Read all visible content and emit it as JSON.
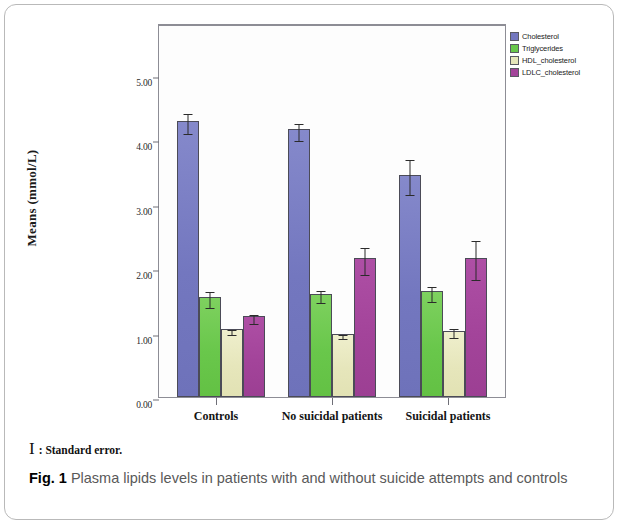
{
  "figure": {
    "label": "Fig. 1",
    "caption": "Plasma lipids levels in patients with and without suicide attempts and controls",
    "footnote_glyph": "I",
    "footnote_text": ": Standard error."
  },
  "chart_data": {
    "type": "bar",
    "title": "",
    "xlabel": "",
    "ylabel": "Means (mmol/L)",
    "ylim": [
      0,
      5.8
    ],
    "yticks": [
      "0.00",
      "1.00",
      "2.00",
      "3.00",
      "4.00",
      "5.00"
    ],
    "ytick_values": [
      0,
      1,
      2,
      3,
      4,
      5
    ],
    "grid": false,
    "legend_position": "right-top",
    "error_bars": "standard error",
    "categories": [
      "Controls",
      "No suicidal patients",
      "Suicidal patients"
    ],
    "series": [
      {
        "name": "Cholesterol",
        "color": "#7377bf",
        "values": [
          4.28,
          4.15,
          3.45
        ],
        "errors": [
          0.15,
          0.13,
          0.27
        ]
      },
      {
        "name": "Triglycerides",
        "color": "#69c74b",
        "values": [
          1.55,
          1.6,
          1.64
        ],
        "errors": [
          0.13,
          0.09,
          0.12
        ]
      },
      {
        "name": "HDL_cholesterol",
        "color": "#e6e6bb",
        "values": [
          1.05,
          0.98,
          1.03
        ],
        "errors": [
          0.04,
          0.03,
          0.07
        ]
      },
      {
        "name": "LDLC_cholesterol",
        "color": "#a3449a",
        "values": [
          1.25,
          2.15,
          2.16
        ],
        "errors": [
          0.07,
          0.21,
          0.3
        ]
      }
    ]
  }
}
